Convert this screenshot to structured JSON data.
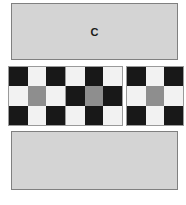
{
  "figure": {
    "panel_top": {
      "label": "C",
      "fill_color": "#d4d4d4",
      "border_color": "#808080"
    },
    "panel_bottom": {
      "label": "",
      "fill_color": "#d4d4d4",
      "border_color": "#808080"
    },
    "palette": {
      "dark": "#181818",
      "light": "#f2f2f2",
      "center_gray": "#8e8e8e",
      "panel_gray": "#d4d4d4",
      "background": "#ffffff"
    },
    "boards": [
      {
        "name": "checkerboard-left",
        "pattern_name": "dark-corners",
        "cells": [
          "dark",
          "light",
          "dark",
          "light",
          "center",
          "light",
          "dark",
          "light",
          "dark"
        ]
      },
      {
        "name": "checkerboard-middle",
        "pattern_name": "light-corners",
        "cells": [
          "light",
          "dark",
          "light",
          "dark",
          "center",
          "dark",
          "light",
          "dark",
          "light"
        ]
      },
      {
        "name": "checkerboard-right",
        "pattern_name": "dark-corners",
        "cells": [
          "dark",
          "light",
          "dark",
          "light",
          "center",
          "light",
          "dark",
          "light",
          "dark"
        ]
      }
    ]
  }
}
